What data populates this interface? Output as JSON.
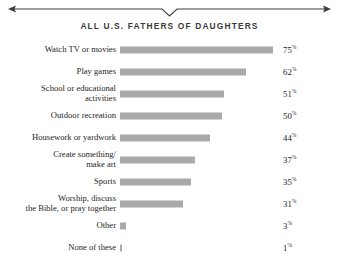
{
  "header": {
    "title": "ALL U.S. FATHERS OF DAUGHTERS",
    "rule_icon": "arrow-rule-with-center-notch"
  },
  "chart_data": {
    "type": "bar",
    "orientation": "horizontal",
    "title": "ALL U.S. FATHERS OF DAUGHTERS",
    "xlabel": "",
    "ylabel": "",
    "xlim": [
      0,
      100
    ],
    "grid": false,
    "legend": false,
    "value_suffix": "%",
    "bar_color": "#a9a9a9",
    "categories": [
      "Watch TV or movies",
      "Play games",
      "School or educational\nactivities",
      "Outdoor recreation",
      "Housework or yardwork",
      "Create something/\nmake art",
      "Sports",
      "Worship, discuss\nthe Bible, or pray together",
      "Other",
      "None of these"
    ],
    "values": [
      75,
      62,
      51,
      50,
      44,
      37,
      35,
      31,
      3,
      1
    ],
    "value_labels": [
      "75",
      "62",
      "51",
      "50",
      "44",
      "37",
      "35",
      "31",
      "3",
      "1"
    ]
  }
}
